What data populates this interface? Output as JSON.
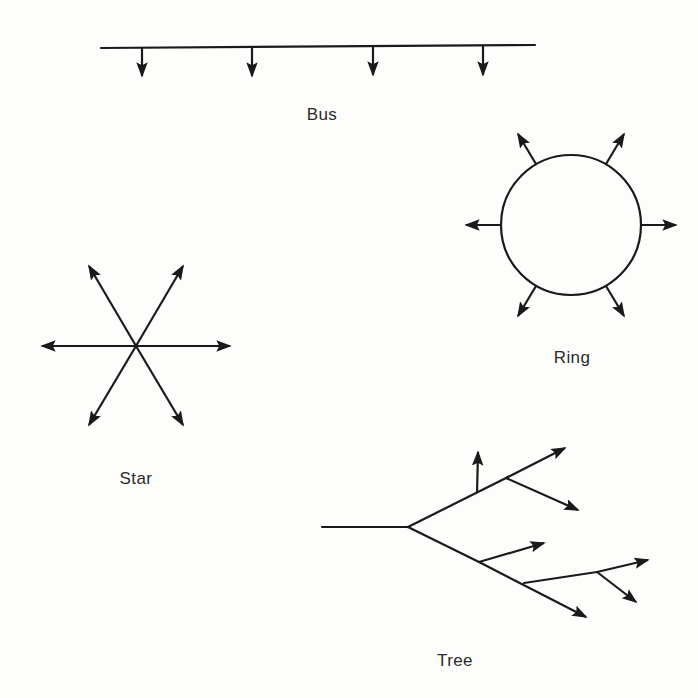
{
  "figure": {
    "background_color": "#fdfdfb",
    "ink_color": "#1a1a1a",
    "line_width": 2
  },
  "labels": {
    "bus": "Bus",
    "ring": "Ring",
    "star": "Star",
    "tree": "Tree"
  },
  "label_positions": {
    "bus": {
      "x": 322,
      "y": 105
    },
    "ring": {
      "x": 572,
      "y": 348
    },
    "star": {
      "x": 136,
      "y": 469
    },
    "tree": {
      "x": 455,
      "y": 651
    }
  },
  "topologies": {
    "bus": {
      "name": "Bus",
      "backbone": {
        "x1": 101,
        "y1": 48,
        "x2": 535,
        "y2": 45
      },
      "node_count": 4,
      "drops": [
        {
          "x": 142,
          "y_start": 47,
          "y_end": 76
        },
        {
          "x": 252,
          "y_start": 47,
          "y_end": 76
        },
        {
          "x": 373,
          "y_start": 46,
          "y_end": 75
        },
        {
          "x": 483,
          "y_start": 46,
          "y_end": 75
        }
      ]
    },
    "ring": {
      "name": "Ring",
      "circle": {
        "cx": 571,
        "cy": 225,
        "r": 70
      },
      "node_count": 6,
      "spoke_angles_deg": [
        0,
        60,
        120,
        180,
        240,
        300
      ],
      "spoke_length": 32
    },
    "star": {
      "name": "Star",
      "center": {
        "x": 136,
        "y": 346
      },
      "node_count": 6,
      "arms": [
        {
          "angle_deg": 0,
          "tip_x": 230,
          "tip_y": 346
        },
        {
          "angle_deg": 60,
          "tip_x": 183,
          "tip_y": 266
        },
        {
          "angle_deg": 120,
          "tip_x": 89,
          "tip_y": 266
        },
        {
          "angle_deg": 180,
          "tip_x": 42,
          "tip_y": 346
        },
        {
          "angle_deg": 240,
          "tip_x": 89,
          "tip_y": 425
        },
        {
          "angle_deg": 300,
          "tip_x": 183,
          "tip_y": 425
        }
      ]
    },
    "tree": {
      "name": "Tree",
      "root": {
        "x": 322,
        "y": 527
      },
      "fork": {
        "x": 408,
        "y": 527
      },
      "leaf_count": 6,
      "segments": [
        {
          "id": "trunk",
          "x1": 322,
          "y1": 527,
          "x2": 408,
          "y2": 527,
          "arrow": false
        },
        {
          "id": "upper-branch",
          "x1": 408,
          "y1": 527,
          "x2": 506,
          "y2": 478,
          "arrow": false
        },
        {
          "id": "upper-stem",
          "x1": 478,
          "y1": 492,
          "x2": 478,
          "y2": 452,
          "arrow": true
        },
        {
          "id": "upper-fork-up",
          "x1": 506,
          "y1": 478,
          "x2": 562,
          "y2": 450,
          "arrow": true
        },
        {
          "id": "upper-fork-down",
          "x1": 506,
          "y1": 478,
          "x2": 576,
          "y2": 508,
          "arrow": true
        },
        {
          "id": "lower-branch",
          "x1": 408,
          "y1": 527,
          "x2": 479,
          "y2": 562,
          "arrow": false
        },
        {
          "id": "lower-stem-up",
          "x1": 479,
          "y1": 562,
          "x2": 541,
          "y2": 544,
          "arrow": true
        },
        {
          "id": "lower-branch-2",
          "x1": 479,
          "y1": 562,
          "x2": 583,
          "y2": 615,
          "arrow": true
        },
        {
          "id": "lower-sub-branch",
          "x1": 524,
          "y1": 583,
          "x2": 597,
          "y2": 572,
          "arrow": false
        },
        {
          "id": "lower-sub-up",
          "x1": 597,
          "y1": 572,
          "x2": 645,
          "y2": 561,
          "arrow": true
        },
        {
          "id": "lower-sub-down",
          "x1": 597,
          "y1": 572,
          "x2": 634,
          "y2": 600,
          "arrow": true
        }
      ]
    }
  }
}
